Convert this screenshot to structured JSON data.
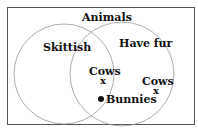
{
  "diagram": {
    "type": "venn",
    "universe_label": "Animals",
    "sets": [
      {
        "name": "Skittish"
      },
      {
        "name": "Have fur"
      }
    ],
    "elements": [
      {
        "label": "Cows",
        "marker": "x",
        "region": "Skittish ∩ Have fur"
      },
      {
        "label": "Cows",
        "marker": "x",
        "region": "Have fur only"
      },
      {
        "label": "Bunnies",
        "marker": "dot",
        "region": "boundary of Skittish within Have fur"
      }
    ],
    "markers": {
      "x": "x",
      "dot": "●"
    }
  }
}
